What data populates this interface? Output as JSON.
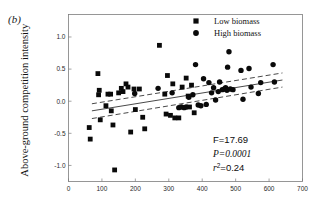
{
  "panel": {
    "label": "(b)"
  },
  "axes": {
    "ylabel": "Above-ground competition intensity",
    "xlabel": "",
    "y_ticks": [
      "1.0",
      "0.5",
      "0.0",
      "-0.5",
      "-1.0"
    ],
    "x_ticks": [
      "0",
      "100",
      "200",
      "300",
      "400",
      "500",
      "600",
      "700"
    ]
  },
  "legend": {
    "items": [
      {
        "label": "Low biomass",
        "marker": "square"
      },
      {
        "label": "High biomass",
        "marker": "circle"
      }
    ]
  },
  "stats": {
    "f_label": "F=17.69",
    "p_label": "P=0.0001",
    "r2_base": "r",
    "r2_exp": "2",
    "r2_value": "=0.24"
  },
  "colors": {
    "marker": "#0a0a0a",
    "frame": "#7d7d7d",
    "line": "#1a1a1a",
    "background": "#ffffff"
  },
  "chart_data": {
    "type": "scatter",
    "title": "",
    "xlabel": "",
    "ylabel": "Above-ground competition intensity",
    "xlim": [
      0,
      700
    ],
    "ylim": [
      -1.25,
      1.35
    ],
    "grid": false,
    "legend_position": "top-right",
    "panel_label": "(b)",
    "annotations": [
      "F=17.69",
      "P=0.0001",
      "r2=0.24"
    ],
    "series": [
      {
        "name": "Low biomass",
        "marker": "square",
        "points": [
          [
            62,
            -0.41
          ],
          [
            65,
            -0.59
          ],
          [
            88,
            0.43
          ],
          [
            90,
            0.1
          ],
          [
            92,
            0.17
          ],
          [
            95,
            -0.29
          ],
          [
            112,
            -0.07
          ],
          [
            118,
            0.11
          ],
          [
            126,
            0.11
          ],
          [
            128,
            -0.15
          ],
          [
            133,
            -0.37
          ],
          [
            138,
            -1.07
          ],
          [
            150,
            0.13
          ],
          [
            158,
            0.2
          ],
          [
            163,
            0.15
          ],
          [
            172,
            0.27
          ],
          [
            178,
            0.22
          ],
          [
            186,
            -0.48
          ],
          [
            196,
            0.19
          ],
          [
            200,
            -0.13
          ],
          [
            212,
            0.19
          ],
          [
            222,
            -0.25
          ],
          [
            228,
            -0.43
          ],
          [
            272,
            0.87
          ],
          [
            288,
            0.11
          ],
          [
            292,
            -0.2
          ],
          [
            296,
            0.4
          ],
          [
            305,
            -0.22
          ],
          [
            312,
            0.27
          ],
          [
            318,
            -0.26
          ],
          [
            330,
            -0.26
          ],
          [
            340,
            0.22
          ],
          [
            352,
            0.36
          ],
          [
            358,
            0.08
          ],
          [
            362,
            -0.09
          ],
          [
            368,
            0.25
          ],
          [
            376,
            -0.18
          ]
        ]
      },
      {
        "name": "High biomass",
        "marker": "circle",
        "points": [
          [
            198,
            0.12
          ],
          [
            268,
            0.2
          ],
          [
            310,
            0.13
          ],
          [
            330,
            -0.1
          ],
          [
            338,
            -0.09
          ],
          [
            346,
            -0.1
          ],
          [
            352,
            -0.09
          ],
          [
            360,
            0.06
          ],
          [
            372,
            0.1
          ],
          [
            380,
            0.57
          ],
          [
            388,
            -0.06
          ],
          [
            396,
            -0.07
          ],
          [
            404,
            0.35
          ],
          [
            412,
            -0.05
          ],
          [
            420,
            0.29
          ],
          [
            428,
            0.13
          ],
          [
            434,
            0.21
          ],
          [
            440,
            0.02
          ],
          [
            448,
            0.15
          ],
          [
            452,
            0.3
          ],
          [
            460,
            0.18
          ],
          [
            466,
            0.19
          ],
          [
            470,
            0.21
          ],
          [
            474,
            0.17
          ],
          [
            476,
            0.53
          ],
          [
            480,
            0.77
          ],
          [
            484,
            0.19
          ],
          [
            492,
            0.18
          ],
          [
            516,
            0.48
          ],
          [
            522,
            0.03
          ],
          [
            540,
            0.51
          ],
          [
            546,
            0.22
          ],
          [
            568,
            0.12
          ],
          [
            575,
            0.29
          ],
          [
            612,
            0.57
          ],
          [
            616,
            0.3
          ]
        ]
      }
    ],
    "fit_line": {
      "x": [
        70,
        640
      ],
      "y": [
        -0.15,
        0.33
      ]
    },
    "ci_upper": {
      "x": [
        70,
        640
      ],
      "y": [
        -0.04,
        0.44
      ]
    },
    "ci_lower": {
      "x": [
        70,
        640
      ],
      "y": [
        -0.27,
        0.22
      ]
    }
  }
}
